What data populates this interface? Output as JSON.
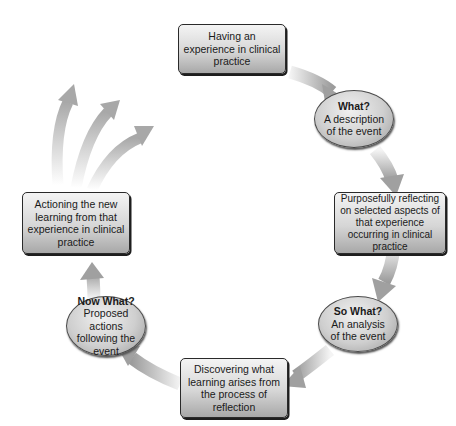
{
  "diagram": {
    "colors": {
      "box_border": "#2a2a2a",
      "arrow": "#b0b0b0",
      "background": "#ffffff"
    },
    "nodes": [
      {
        "id": "having-experience",
        "shape": "rounded-rect",
        "text": "Having an experience in clinical practice"
      },
      {
        "id": "what",
        "shape": "oval",
        "question": "What?",
        "text": "A description of the event"
      },
      {
        "id": "purposefully-reflecting",
        "shape": "rounded-rect",
        "text": "Purposefully reflecting on selected aspects of that experience occurring in clinical practice"
      },
      {
        "id": "so-what",
        "shape": "oval",
        "question": "So What?",
        "text": "An analysis of the event"
      },
      {
        "id": "discovering-learning",
        "shape": "rounded-rect",
        "text": "Discovering what learning arises from the process of reflection"
      },
      {
        "id": "now-what",
        "shape": "oval",
        "question": "Now What?",
        "text": "Proposed actions following the event"
      },
      {
        "id": "actioning-learning",
        "shape": "rounded-rect",
        "text": "Actioning the new learning from that experience in clinical practice"
      }
    ],
    "edges": [
      {
        "from": "having-experience",
        "to": "what"
      },
      {
        "from": "what",
        "to": "purposefully-reflecting"
      },
      {
        "from": "purposefully-reflecting",
        "to": "so-what"
      },
      {
        "from": "so-what",
        "to": "discovering-learning"
      },
      {
        "from": "discovering-learning",
        "to": "now-what"
      },
      {
        "from": "now-what",
        "to": "actioning-learning"
      },
      {
        "from": "actioning-learning",
        "to": "outward",
        "count": 3
      }
    ]
  }
}
